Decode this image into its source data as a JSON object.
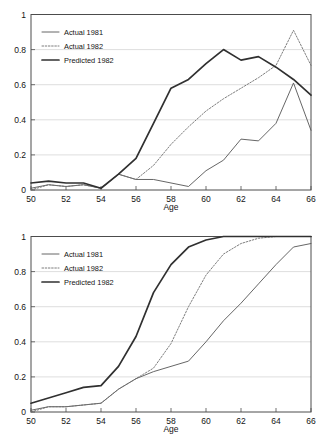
{
  "chart_data": [
    {
      "id": "top",
      "type": "line",
      "title": "",
      "xlabel": "Age",
      "ylabel": "",
      "xlim": [
        50,
        66
      ],
      "ylim": [
        0,
        1
      ],
      "xticks": [
        50,
        52,
        54,
        56,
        58,
        60,
        62,
        64,
        66
      ],
      "xticklabels": [
        "50",
        "52",
        "54",
        "56",
        "58",
        "60",
        "62",
        "64",
        "66"
      ],
      "yticks": [
        0,
        0.2,
        0.4,
        0.6,
        0.8,
        1
      ],
      "yticklabels": [
        "0",
        "0.2",
        "0.4",
        "0.6",
        "0.8",
        "1"
      ],
      "grid": "horizontal",
      "legend_position": "top-left",
      "x": [
        50,
        51,
        52,
        53,
        54,
        55,
        56,
        57,
        58,
        59,
        60,
        61,
        62,
        63,
        64,
        65,
        66
      ],
      "series": [
        {
          "name": "Actual 1981",
          "style": "solid-thin",
          "color": "#555555",
          "values": [
            0.01,
            0.03,
            0.02,
            0.03,
            0.01,
            0.09,
            0.06,
            0.06,
            0.04,
            0.02,
            0.11,
            0.17,
            0.29,
            0.28,
            0.38,
            0.61,
            0.34
          ]
        },
        {
          "name": "Actual 1982",
          "style": "dotted",
          "color": "#6e6e6e",
          "values": [
            0.0,
            0.03,
            0.02,
            0.03,
            0.01,
            0.09,
            0.06,
            0.14,
            0.26,
            0.36,
            0.45,
            0.52,
            0.58,
            0.64,
            0.71,
            0.91,
            0.71
          ]
        },
        {
          "name": "Predicted 1982",
          "style": "solid-thick",
          "color": "#303030",
          "values": [
            0.04,
            0.05,
            0.04,
            0.04,
            0.01,
            0.09,
            0.18,
            0.38,
            0.58,
            0.63,
            0.72,
            0.8,
            0.74,
            0.76,
            0.7,
            0.63,
            0.54
          ]
        }
      ]
    },
    {
      "id": "bottom",
      "type": "line",
      "title": "",
      "xlabel": "Age",
      "ylabel": "",
      "xlim": [
        50,
        66
      ],
      "ylim": [
        0,
        1
      ],
      "xticks": [
        50,
        52,
        54,
        56,
        58,
        60,
        62,
        64,
        66
      ],
      "xticklabels": [
        "50",
        "52",
        "54",
        "56",
        "58",
        "60",
        "62",
        "64",
        "66"
      ],
      "yticks": [
        0,
        0.2,
        0.4,
        0.6,
        0.8,
        1
      ],
      "yticklabels": [
        "0",
        "0.2",
        "0.4",
        "0.6",
        "0.8",
        "1"
      ],
      "grid": "horizontal",
      "legend_position": "top-left",
      "x": [
        50,
        51,
        52,
        53,
        54,
        55,
        56,
        57,
        58,
        59,
        60,
        61,
        62,
        63,
        64,
        65,
        66
      ],
      "series": [
        {
          "name": "Actual 1981",
          "style": "solid-thin",
          "color": "#555555",
          "values": [
            0.01,
            0.03,
            0.03,
            0.04,
            0.05,
            0.13,
            0.19,
            0.23,
            0.26,
            0.29,
            0.4,
            0.52,
            0.62,
            0.73,
            0.84,
            0.94,
            0.96
          ]
        },
        {
          "name": "Actual 1982",
          "style": "dotted",
          "color": "#6e6e6e",
          "values": [
            0.0,
            0.03,
            0.03,
            0.04,
            0.05,
            0.13,
            0.19,
            0.25,
            0.39,
            0.6,
            0.78,
            0.9,
            0.96,
            0.99,
            1.0,
            1.0,
            1.0
          ]
        },
        {
          "name": "Predicted 1982",
          "style": "solid-thick",
          "color": "#303030",
          "values": [
            0.05,
            0.08,
            0.11,
            0.14,
            0.15,
            0.26,
            0.43,
            0.68,
            0.84,
            0.94,
            0.98,
            1.0,
            1.0,
            1.0,
            1.0,
            1.0,
            1.0
          ]
        }
      ]
    }
  ],
  "charts": {
    "top": {
      "legend": [
        {
          "label": "Actual 1981"
        },
        {
          "label": "Actual 1982"
        },
        {
          "label": "Predicted 1982"
        }
      ],
      "xlabel": "Age",
      "xticklabels": [
        "50",
        "52",
        "54",
        "56",
        "58",
        "60",
        "62",
        "64",
        "66"
      ],
      "yticklabels": [
        "0",
        "0.2",
        "0.4",
        "0.6",
        "0.8",
        "1"
      ]
    },
    "bottom": {
      "legend": [
        {
          "label": "Actual 1981"
        },
        {
          "label": "Actual 1982"
        },
        {
          "label": "Predicted 1982"
        }
      ],
      "xlabel": "Age",
      "xticklabels": [
        "50",
        "52",
        "54",
        "56",
        "58",
        "60",
        "62",
        "64",
        "66"
      ],
      "yticklabels": [
        "0",
        "0.2",
        "0.4",
        "0.6",
        "0.8",
        "1"
      ]
    }
  }
}
